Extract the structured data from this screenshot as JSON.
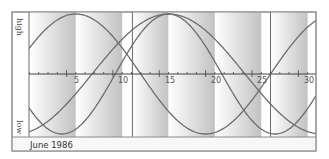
{
  "chart_data": {
    "type": "line",
    "title": "",
    "footer": "June 1986",
    "xlabel": "",
    "ylabel_high": "high",
    "ylabel_low": "low",
    "x_range": [
      1,
      31
    ],
    "x_ticks": [
      5,
      10,
      15,
      20,
      25,
      30
    ],
    "x_tick_labels": [
      "5",
      "10",
      "15",
      "20",
      "25",
      "30"
    ],
    "minor_ticks_every": 1,
    "y_range": [
      -1,
      1
    ],
    "grid": false,
    "marker_lines_days": [
      12.1,
      27
    ],
    "shaded_bands": [
      {
        "from": 1,
        "to": 6
      },
      {
        "from": 6,
        "to": 11
      },
      {
        "from": 12.1,
        "to": 16
      },
      {
        "from": 16,
        "to": 21
      },
      {
        "from": 21,
        "to": 26
      },
      {
        "from": 27,
        "to": 31
      }
    ],
    "series": [
      {
        "name": "Curve A",
        "period_days": 28,
        "peak_day": 6,
        "description": "starts above zero, peaks ~day 6, trough ~day 20"
      },
      {
        "name": "Curve B",
        "period_days": 23,
        "peak_day": 16,
        "description": "starts low, crosses up ~day 10.5, peaks ~day 16, trough ~day 27.5"
      },
      {
        "name": "Curve C",
        "period_days": 33,
        "peak_day": 16,
        "description": "trough ~day 4, peaks ~day 16, crosses down ~day 24, trough ~day 30"
      }
    ]
  },
  "labels": {
    "high": "high",
    "low": "low",
    "footer": "June 1986",
    "ticks": [
      "5",
      "10",
      "15",
      "20",
      "25",
      "30"
    ]
  },
  "colors": {
    "curve": "#6e6e6e",
    "frame": "#7a7a7a",
    "axis": "#444444",
    "band_dark": "#c4c4c4",
    "band_light": "#ffffff"
  }
}
